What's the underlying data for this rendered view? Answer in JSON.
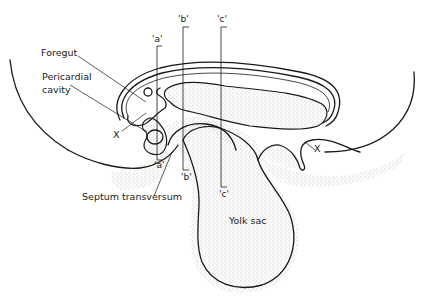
{
  "figure": {
    "type": "embryology sagittal section diagram",
    "labels": {
      "foregut": "Foregut",
      "pericardial_cavity_line1": "Pericardial",
      "pericardial_cavity_line2": "cavity",
      "x_left": "X",
      "x_right": "X",
      "septum_transversum": "Septum transversum",
      "yolk_sac": "Yolk sac"
    },
    "section_markers": [
      {
        "id": "a",
        "top_label": "'a'",
        "bottom_label": "'a'"
      },
      {
        "id": "b",
        "top_label": "'b'",
        "bottom_label": "'b'"
      },
      {
        "id": "c",
        "top_label": "'c'",
        "bottom_label": "'c'"
      }
    ],
    "colors": {
      "ink": "#1a1a1a",
      "background": "#ffffff",
      "stipple": "#6a6a6a"
    }
  }
}
